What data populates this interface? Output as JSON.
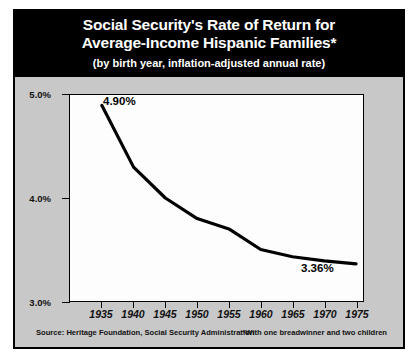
{
  "chart_data": {
    "type": "line",
    "title_line1": "Social Security's Rate of Return for",
    "title_line2": "Average-Income Hispanic Families*",
    "subtitle": "(by birth year, inflation-adjusted annual rate)",
    "xlabel": "",
    "ylabel": "",
    "xlim": [
      1932,
      1978
    ],
    "ylim": [
      3.0,
      5.0
    ],
    "grid": false,
    "legend": "none",
    "x_tick_labels": [
      "1935",
      "1940",
      "1945",
      "1950",
      "1955",
      "1960",
      "1965",
      "1970",
      "1975"
    ],
    "x_tick_values": [
      1935,
      1940,
      1945,
      1950,
      1955,
      1960,
      1965,
      1970,
      1975
    ],
    "y_tick_labels": [
      "5.0%",
      "4.0%",
      "3.0%"
    ],
    "y_tick_values": [
      5.0,
      4.0,
      3.0
    ],
    "series": [
      {
        "name": "Average-Income Hispanic Families",
        "x": [
          1935,
          1940,
          1945,
          1950,
          1955,
          1960,
          1965,
          1970,
          1975
        ],
        "values": [
          4.9,
          4.3,
          4.0,
          3.8,
          3.7,
          3.5,
          3.43,
          3.39,
          3.36
        ]
      }
    ],
    "annotations": [
      {
        "text": "4.90%",
        "x": 1935,
        "y": 4.9
      },
      {
        "text": "3.36%",
        "x": 1975,
        "y": 3.36
      }
    ],
    "source_note": "Source:  Heritage Foundation, Social Security Administration",
    "footnote": "*With one breadwinner and two children",
    "colors": {
      "panel_background": "#c8c8c8",
      "plot_background": "#fdfdfd",
      "title_background": "#000000",
      "title_text": "#ffffff",
      "line": "#000000",
      "axis": "#000000"
    }
  }
}
